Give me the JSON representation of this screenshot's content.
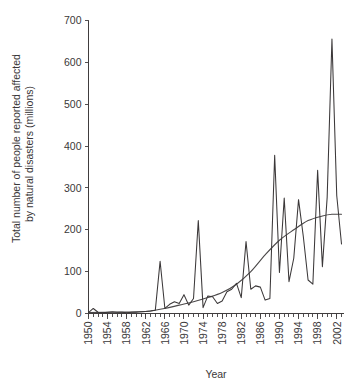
{
  "chart_data": {
    "type": "line",
    "title": "",
    "xlabel": "Year",
    "ylabel": "Total number of people reported affected by natural disasters (millions)",
    "ylabel_line1": "Total number of people reported affected",
    "ylabel_line2": "by natural disasters (millions)",
    "xlim": [
      1950,
      2003
    ],
    "ylim": [
      0,
      700
    ],
    "y_ticks": [
      0,
      100,
      200,
      300,
      400,
      500,
      600,
      700
    ],
    "y_tick_labels": [
      "0",
      "100",
      "200",
      "300",
      "400",
      "500",
      "600",
      "700"
    ],
    "x_ticks": [
      1950,
      1954,
      1958,
      1962,
      1966,
      1970,
      1974,
      1978,
      1982,
      1986,
      1990,
      1994,
      1998,
      2002
    ],
    "x_tick_labels": [
      "1950",
      "1954",
      "1958",
      "1962",
      "1966",
      "1970",
      "1974",
      "1978",
      "1982",
      "1986",
      "1990",
      "1994",
      "1998",
      "2002"
    ],
    "x_minor_tick_step": 1,
    "grid": false,
    "legend": false,
    "legend_position": "none",
    "series": [
      {
        "name": "Total people reported affected",
        "style": "jagged-line",
        "color": "#3b3839",
        "x": [
          1950,
          1951,
          1952,
          1953,
          1954,
          1955,
          1956,
          1957,
          1958,
          1959,
          1960,
          1961,
          1962,
          1963,
          1964,
          1965,
          1966,
          1967,
          1968,
          1969,
          1970,
          1971,
          1972,
          1973,
          1974,
          1975,
          1976,
          1977,
          1978,
          1979,
          1980,
          1981,
          1982,
          1983,
          1984,
          1985,
          1986,
          1987,
          1988,
          1989,
          1990,
          1991,
          1992,
          1993,
          1994,
          1995,
          1996,
          1997,
          1998,
          1999,
          2000,
          2001,
          2002,
          2003
        ],
        "values": [
          2,
          12,
          3,
          2,
          3,
          4,
          3,
          3,
          2,
          3,
          3,
          4,
          5,
          6,
          8,
          125,
          12,
          22,
          28,
          24,
          45,
          20,
          36,
          222,
          14,
          42,
          40,
          24,
          30,
          52,
          58,
          72,
          38,
          172,
          58,
          66,
          63,
          32,
          36,
          378,
          98,
          276,
          76,
          132,
          272,
          184,
          80,
          70,
          342,
          112,
          278,
          656,
          282,
          166
        ]
      },
      {
        "name": "Trend (smoothed)",
        "style": "smooth-curve",
        "color": "#4a4748",
        "x": [
          1950,
          1955,
          1960,
          1963,
          1966,
          1969,
          1972,
          1975,
          1978,
          1981,
          1984,
          1987,
          1990,
          1993,
          1996,
          1999,
          2001,
          2003
        ],
        "values": [
          2,
          3,
          4,
          6,
          12,
          20,
          28,
          38,
          50,
          70,
          100,
          140,
          175,
          200,
          222,
          233,
          237,
          237
        ]
      }
    ]
  }
}
